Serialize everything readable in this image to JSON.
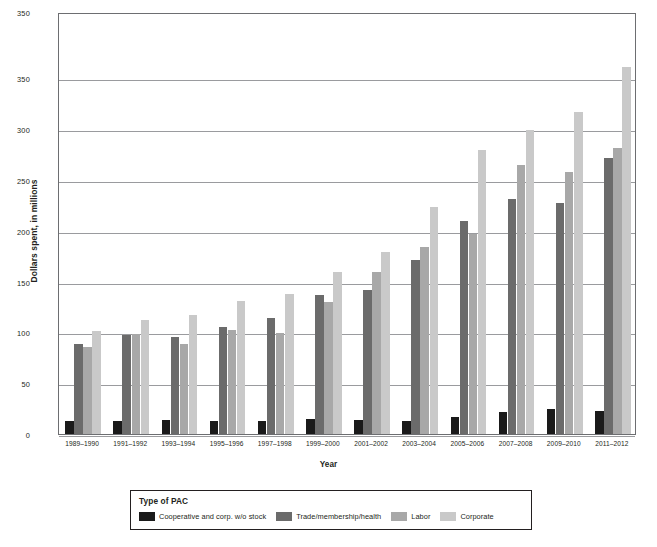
{
  "chart_data": {
    "type": "bar",
    "title": "",
    "xlabel": "Year",
    "ylabel": "Dollars spent, in millions",
    "ylim": [
      0,
      415
    ],
    "ytick_labels": [
      "350",
      "350",
      "300",
      "250",
      "200",
      "150",
      "100",
      "50",
      "0"
    ],
    "ytick_values": [
      415,
      350,
      300,
      250,
      200,
      150,
      100,
      50,
      0
    ],
    "grid": true,
    "legend_position": "bottom",
    "legend_title": "Type of PAC",
    "categories": [
      "1989–1990",
      "1991–1992",
      "1993–1994",
      "1995–1996",
      "1997–1998",
      "1999–2000",
      "2001–2002",
      "2003–2004",
      "2005–2006",
      "2007–2008",
      "2009–2010",
      "2011–2012"
    ],
    "series": [
      {
        "name": "Cooperative and corp. w/o stock",
        "color": "#1a1a1a",
        "values": [
          13,
          13,
          14,
          13,
          13,
          15,
          14,
          13,
          17,
          22,
          25,
          23
        ]
      },
      {
        "name": "Trade/membership/health",
        "color": "#6b6b6b",
        "values": [
          89,
          97,
          95,
          105,
          114,
          137,
          142,
          171,
          210,
          231,
          227,
          271
        ]
      },
      {
        "name": "Labor",
        "color": "#a8a8a8",
        "values": [
          86,
          98,
          89,
          102,
          99,
          130,
          159,
          184,
          197,
          265,
          258,
          281
        ]
      },
      {
        "name": "Corporate",
        "color": "#c9c9c9",
        "values": [
          101,
          112,
          117,
          131,
          138,
          159,
          179,
          223,
          279,
          299,
          317,
          361
        ]
      }
    ]
  }
}
